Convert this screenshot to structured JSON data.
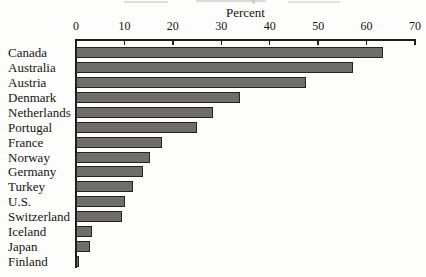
{
  "chart_data": {
    "type": "bar",
    "orientation": "horizontal",
    "title": "",
    "xlabel": "Percent",
    "ylabel": "",
    "xlim": [
      0,
      70
    ],
    "x_ticks": [
      0,
      10,
      20,
      30,
      40,
      50,
      60,
      70
    ],
    "axis_position": "top",
    "grid": false,
    "legend": false,
    "categories": [
      "Canada",
      "Australia",
      "Austria",
      "Denmark",
      "Netherlands",
      "Portugal",
      "France",
      "Norway",
      "Germany",
      "Turkey",
      "U.S.",
      "Switzerland",
      "Iceland",
      "Japan",
      "Finland"
    ],
    "values": [
      63.3,
      57.2,
      47.5,
      33.8,
      28.2,
      25,
      17.8,
      15.2,
      13.8,
      11.8,
      10.2,
      9.6,
      3.4,
      2.9,
      0.6
    ],
    "colors": {
      "bar_fill": "#6f6e6c",
      "bar_border": "#242424",
      "axis": "#1c1c1c",
      "text": "#141414",
      "background": "#fdfdfb"
    }
  }
}
